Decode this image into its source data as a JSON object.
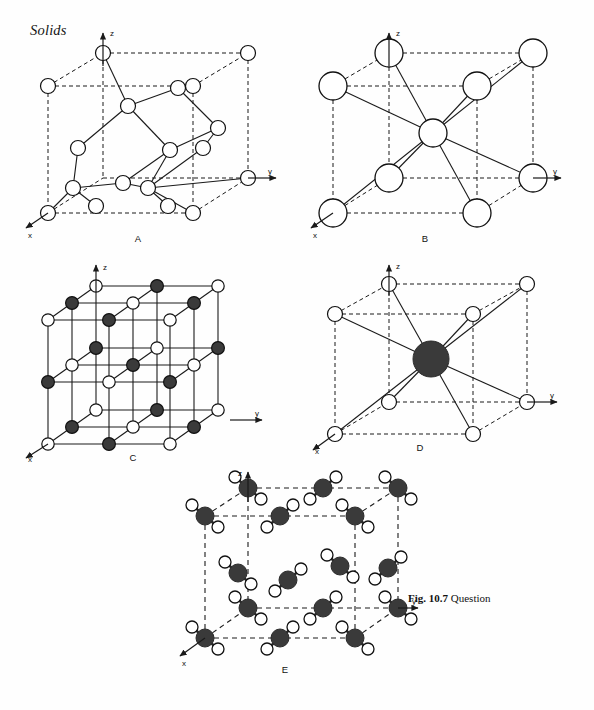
{
  "page": {
    "running_head": "Solids",
    "background": "#fefefe",
    "ink": "#111111"
  },
  "caption": {
    "figure_number": "Fig. 10.7",
    "text": " Question"
  },
  "colors": {
    "line": "#1a1a1a",
    "dashed": "#1a1a1a",
    "atom_open_fill": "#ffffff",
    "atom_filled_fill": "#3a3a3a",
    "atom_stroke": "#111111"
  },
  "axes": {
    "x_label": "x",
    "y_label": "y",
    "z_label": "z"
  },
  "panels": [
    {
      "id": "A",
      "label": "A",
      "structure": "diamond-cubic",
      "description": "Cubic cell with open circles at 8 corners, 6 face centres and 4 internal tetrahedrally bonded atoms",
      "atom_types": [
        "open"
      ],
      "axes_shown": [
        "x",
        "y",
        "z"
      ]
    },
    {
      "id": "B",
      "label": "B",
      "structure": "body-centred-cubic",
      "description": "Cubic cell with large open circles at the 8 corners bonded to a single open circle at the body centre",
      "atom_types": [
        "open"
      ],
      "axes_shown": [
        "x",
        "y",
        "z"
      ]
    },
    {
      "id": "C",
      "label": "C",
      "structure": "rock-salt",
      "description": "Three by three by three array of alternating filled and open circles joined by solid rods",
      "atom_types": [
        "open",
        "filled"
      ],
      "axes_shown": [
        "x",
        "y",
        "z"
      ]
    },
    {
      "id": "D",
      "label": "D",
      "structure": "caesium-chloride",
      "description": "Cubic cell with small open circles at the 8 corners bonded to one large filled circle at the body centre",
      "atom_types": [
        "open",
        "filled"
      ],
      "axes_shown": [
        "x",
        "y",
        "z"
      ]
    },
    {
      "id": "E",
      "label": "E",
      "structure": "ice",
      "description": "Cubic cell containing water molecules, each a large filled oxygen with two small open hydrogen atoms",
      "atom_types": [
        "open",
        "filled"
      ],
      "axes_shown": [
        "x",
        "y",
        "z"
      ]
    }
  ]
}
